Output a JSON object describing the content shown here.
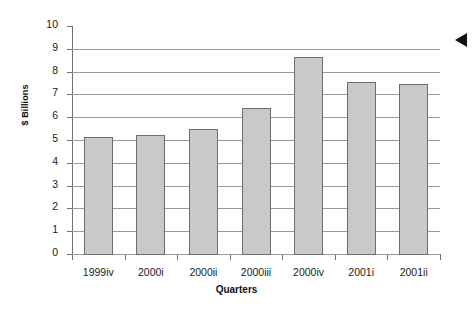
{
  "chart_data": {
    "type": "bar",
    "title": "",
    "xlabel": "Quarters",
    "ylabel": "$ Billions",
    "categories": [
      "1999iv",
      "2000i",
      "2000ii",
      "2000iii",
      "2000iv",
      "2001i",
      "2001ii"
    ],
    "values": [
      5.15,
      5.2,
      5.5,
      6.4,
      8.65,
      7.55,
      7.45
    ],
    "ylim": [
      0,
      10
    ],
    "yticks": [
      0,
      1,
      2,
      3,
      4,
      5,
      6,
      7,
      8,
      9,
      10
    ],
    "ytick_labels": [
      "0",
      "1",
      "2",
      "3",
      "4",
      "5",
      "6",
      "7",
      "8",
      "9",
      "10"
    ],
    "grid": true,
    "legend": false,
    "bar_color": "#c9c9c9",
    "bar_edge_color": "#6d6d6d",
    "gridline_color": "#9a9a9a",
    "axis_color": "#6f6f6f"
  },
  "annotations": {
    "edge_marker": "left-pointing-triangle"
  }
}
